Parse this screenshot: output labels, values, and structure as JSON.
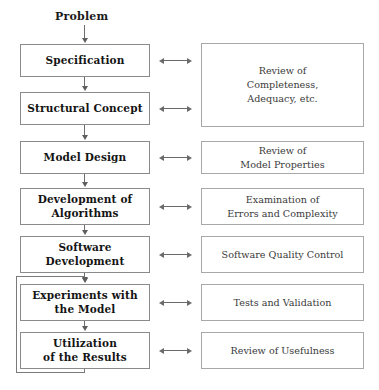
{
  "diagram": {
    "entry_label": "Problem",
    "process_steps": [
      {
        "id": "specification",
        "label": "Specification"
      },
      {
        "id": "structural-concept",
        "label": "Structural Concept"
      },
      {
        "id": "model-design",
        "label": "Model Design"
      },
      {
        "id": "development-of-algorithms",
        "label": "Development of\nAlgorithms"
      },
      {
        "id": "software-development",
        "label": "Software\nDevelopment"
      },
      {
        "id": "experiments-with-the-model",
        "label": "Experiments with\nthe Model"
      },
      {
        "id": "utilization-of-the-results",
        "label": "Utilization\nof the Results"
      }
    ],
    "review_steps": [
      {
        "id": "review-completeness",
        "label": "Review of\nCompleteness,\nAdequacy, etc."
      },
      {
        "id": "review-model-properties",
        "label": "Review of\nModel Properties"
      },
      {
        "id": "examination-errors",
        "label": "Examination of\nErrors and Complexity"
      },
      {
        "id": "software-quality-control",
        "label": "Software Quality Control"
      },
      {
        "id": "tests-and-validation",
        "label": "Tests and Validation"
      },
      {
        "id": "review-of-usefulness",
        "label": "Review of Usefulness"
      }
    ],
    "link_arrow_glyph": "bidirectional-arrow",
    "colors": {
      "box_border": "#8a8a8a",
      "review_border": "#a8a8a8",
      "connector": "#6e6e6e",
      "text": "#141414",
      "review_text": "#3a3a3a",
      "background": "#ffffff"
    }
  }
}
